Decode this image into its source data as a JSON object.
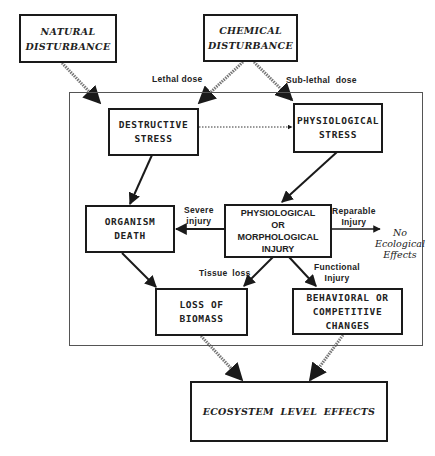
{
  "diagram": {
    "type": "flowchart",
    "nodes": {
      "natural_disturbance": {
        "line1": "NATURAL",
        "line2": "DISTURBANCE"
      },
      "chemical_disturbance": {
        "line1": "CHEMICAL",
        "line2": "DISTURBANCE"
      },
      "destructive_stress": {
        "line1": "DESTRUCTIVE",
        "line2": "STRESS"
      },
      "physiological_stress": {
        "line1": "PHYSIOLOGICAL",
        "line2": "STRESS"
      },
      "organism_death": {
        "line1": "ORGANISM",
        "line2": "DEATH"
      },
      "injury": {
        "line1": "PHYSIOLOGICAL",
        "line2": "OR",
        "line3": "MORPHOLOGICAL",
        "line4": "INJURY"
      },
      "loss_of_biomass": {
        "line1": "LOSS OF",
        "line2": "BIOMASS"
      },
      "behavioral": {
        "line1": "BEHAVIORAL OR",
        "line2": "COMPETITIVE",
        "line3": "CHANGES"
      },
      "ecosystem": {
        "line1": "ECOSYSTEM LEVEL EFFECTS"
      },
      "no_effects": {
        "line1": "No",
        "line2": "Ecological",
        "line3": "Effects"
      }
    },
    "edge_labels": {
      "lethal_dose": "Lethal dose",
      "sublethal_dose": "Sub-lethal dose",
      "severe_injury_1": "Severe",
      "severe_injury_2": "injury",
      "reparable_1": "Reparable",
      "reparable_2": "Injury",
      "tissue_loss": "Tissue loss",
      "functional_1": "Functional",
      "functional_2": "Injury"
    },
    "edges": [
      {
        "from": "natural_disturbance",
        "to": "destructive_stress",
        "style": "hatched"
      },
      {
        "from": "chemical_disturbance",
        "to": "destructive_stress",
        "style": "hatched",
        "label": "Lethal dose"
      },
      {
        "from": "chemical_disturbance",
        "to": "physiological_stress",
        "style": "hatched",
        "label": "Sub-lethal dose"
      },
      {
        "from": "destructive_stress",
        "to": "physiological_stress",
        "style": "dotted"
      },
      {
        "from": "destructive_stress",
        "to": "organism_death",
        "style": "solid"
      },
      {
        "from": "physiological_stress",
        "to": "injury",
        "style": "solid"
      },
      {
        "from": "injury",
        "to": "organism_death",
        "style": "solid",
        "label": "Severe injury"
      },
      {
        "from": "injury",
        "to": "no_effects",
        "style": "solid",
        "label": "Reparable Injury"
      },
      {
        "from": "organism_death",
        "to": "loss_of_biomass",
        "style": "solid"
      },
      {
        "from": "injury",
        "to": "loss_of_biomass",
        "style": "solid",
        "label": "Tissue loss"
      },
      {
        "from": "injury",
        "to": "behavioral",
        "style": "solid",
        "label": "Functional Injury"
      },
      {
        "from": "loss_of_biomass",
        "to": "ecosystem",
        "style": "hatched"
      },
      {
        "from": "behavioral",
        "to": "ecosystem",
        "style": "hatched"
      }
    ]
  }
}
